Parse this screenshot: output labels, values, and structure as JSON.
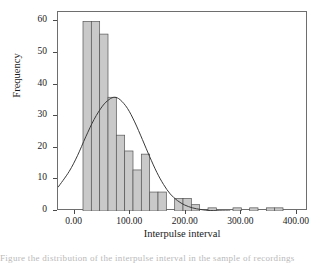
{
  "chart_data": {
    "type": "bar",
    "title": "",
    "subtitle": "",
    "xlabel": "Interpulse interval",
    "ylabel": "Frequency",
    "xlim": [
      -30,
      420
    ],
    "ylim": [
      0,
      63
    ],
    "grid": false,
    "legend": null,
    "xticks": [
      "0.00",
      "100.00",
      "200.00",
      "300.00",
      "400.00"
    ],
    "xtick_values": [
      0,
      100,
      200,
      300,
      400
    ],
    "yticks": [
      "0",
      "10",
      "20",
      "30",
      "40",
      "50",
      "60"
    ],
    "ytick_values": [
      0,
      10,
      20,
      30,
      40,
      50,
      60
    ],
    "bin_width": 15,
    "bar_fill": "#c9c9c9",
    "bar_edge": "#555555",
    "curve_color": "#3a3a3a",
    "curve_label": "normal distribution fit",
    "bins": [
      {
        "left": 15,
        "right": 30,
        "center": 22.5,
        "value": 60
      },
      {
        "left": 30,
        "right": 45,
        "center": 37.5,
        "value": 60
      },
      {
        "left": 45,
        "right": 60,
        "center": 52.5,
        "value": 56
      },
      {
        "left": 60,
        "right": 75,
        "center": 67.5,
        "value": 36
      },
      {
        "left": 75,
        "right": 90,
        "center": 82.5,
        "value": 24
      },
      {
        "left": 90,
        "right": 105,
        "center": 97.5,
        "value": 19
      },
      {
        "left": 105,
        "right": 120,
        "center": 112.5,
        "value": 13
      },
      {
        "left": 120,
        "right": 135,
        "center": 127.5,
        "value": 18
      },
      {
        "left": 135,
        "right": 150,
        "center": 142.5,
        "value": 6
      },
      {
        "left": 150,
        "right": 165,
        "center": 157.5,
        "value": 6
      },
      {
        "left": 180,
        "right": 195,
        "center": 187.5,
        "value": 4
      },
      {
        "left": 195,
        "right": 210,
        "center": 202.5,
        "value": 4
      },
      {
        "left": 210,
        "right": 225,
        "center": 217.5,
        "value": 2
      },
      {
        "left": 240,
        "right": 255,
        "center": 247.5,
        "value": 1
      },
      {
        "left": 285,
        "right": 300,
        "center": 292.5,
        "value": 1
      },
      {
        "left": 315,
        "right": 330,
        "center": 322.5,
        "value": 1
      },
      {
        "left": 345,
        "right": 360,
        "center": 352.5,
        "value": 1
      },
      {
        "left": 360,
        "right": 375,
        "center": 367.5,
        "value": 1
      }
    ],
    "fit_curve": {
      "mean": 72,
      "peak_value": 36,
      "left_edge_value": 7.5,
      "points": [
        {
          "x": -30,
          "y": 7.5
        },
        {
          "x": -10,
          "y": 12.5
        },
        {
          "x": 5,
          "y": 17.5
        },
        {
          "x": 20,
          "y": 23.5
        },
        {
          "x": 35,
          "y": 29.0
        },
        {
          "x": 50,
          "y": 33.2
        },
        {
          "x": 62,
          "y": 35.3
        },
        {
          "x": 72,
          "y": 36.0
        },
        {
          "x": 82,
          "y": 35.2
        },
        {
          "x": 95,
          "y": 32.5
        },
        {
          "x": 108,
          "y": 28.2
        },
        {
          "x": 122,
          "y": 22.6
        },
        {
          "x": 135,
          "y": 17.2
        },
        {
          "x": 148,
          "y": 12.2
        },
        {
          "x": 160,
          "y": 8.4
        },
        {
          "x": 172,
          "y": 5.4
        },
        {
          "x": 185,
          "y": 3.3
        },
        {
          "x": 198,
          "y": 1.9
        },
        {
          "x": 212,
          "y": 1.0
        },
        {
          "x": 226,
          "y": 0.5
        },
        {
          "x": 240,
          "y": 0.2
        },
        {
          "x": 260,
          "y": 0.05
        },
        {
          "x": 280,
          "y": 0.0
        }
      ]
    }
  },
  "axes": {
    "y_title": "Frequency",
    "x_title": "Interpulse interval"
  },
  "caption": {
    "partial_text": "Figure   the   distribution   of   the   interpulse   interval   in   the   sample   of   recordings"
  }
}
